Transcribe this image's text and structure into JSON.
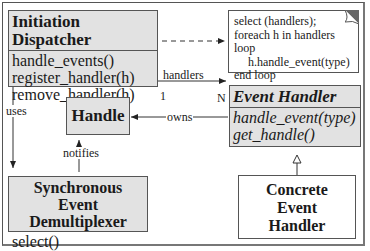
{
  "diagram": {
    "type": "uml-class-diagram",
    "classes": [
      {
        "id": "initiation-dispatcher",
        "name": "Initiation Dispatcher",
        "operations": [
          "handle_events()",
          "register_handler(h)",
          "remove_handler(h)"
        ]
      },
      {
        "id": "handle",
        "name": "Handle",
        "operations": []
      },
      {
        "id": "event-handler",
        "name": "Event Handler",
        "abstract": true,
        "operations": [
          "handle_event(type)",
          "get_handle()"
        ]
      },
      {
        "id": "sync-demux",
        "name_line1": "Synchronous Event",
        "name_line2": "Demultiplexer",
        "operations": [
          "select()"
        ]
      },
      {
        "id": "concrete-handler",
        "name_line1": "Concrete",
        "name_line2": "Event",
        "name_line3": "Handler"
      }
    ],
    "note": {
      "lines": [
        "select (handlers);",
        "foreach h in handlers loop",
        "    h.handle_event(type)",
        "end loop"
      ]
    },
    "relations": {
      "handlers": "handlers",
      "mult_one": "1",
      "mult_many": "N",
      "owns": "owns",
      "uses": "uses",
      "notifies": "notifies"
    },
    "colors": {
      "box_fill": "#e2e2e2",
      "border": "#555555",
      "background": "#ffffff"
    }
  }
}
